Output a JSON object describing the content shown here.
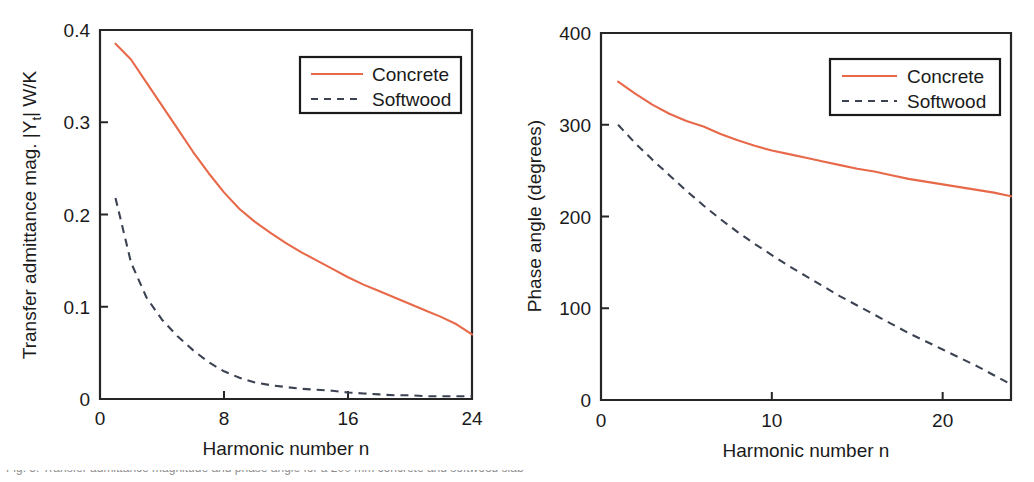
{
  "figure": {
    "background": "#ffffff",
    "concrete_color": "#e8694a",
    "softwood_color": "#3b4252",
    "axis_color": "#262626",
    "caption_fragment": "Fig. 5. Transfer admittance magnitude and phase angle for a 200 mm concrete and softwood slab"
  },
  "legend": {
    "concrete_label": "Concrete",
    "softwood_label": "Softwood"
  },
  "chart_data": [
    {
      "type": "line",
      "id": "transfer-admittance-magnitude",
      "title": "",
      "xlabel": "Harmonic number n",
      "ylabel": "Transfer admittance mag. |Y",
      "ylabel_sub": "t",
      "ylabel_tail": "| W/K",
      "xlim": [
        0,
        24
      ],
      "ylim": [
        0,
        0.4
      ],
      "xticks": [
        0,
        8,
        16,
        24
      ],
      "xticklabels": [
        "0",
        "8",
        "16",
        "24"
      ],
      "yticks": [
        0,
        0.1,
        0.2,
        0.3,
        0.4
      ],
      "yticklabels": [
        "0",
        "0.1",
        "0.2",
        "0.3",
        "0.4"
      ],
      "grid": false,
      "legend_position": "upper right",
      "x": [
        1,
        2,
        3,
        4,
        5,
        6,
        7,
        8,
        9,
        10,
        11,
        12,
        13,
        14,
        15,
        16,
        17,
        18,
        19,
        20,
        21,
        22,
        23,
        24
      ],
      "series": [
        {
          "name": "Concrete",
          "style": "solid",
          "color": "#e8694a",
          "values": [
            0.385,
            0.368,
            0.343,
            0.318,
            0.293,
            0.268,
            0.245,
            0.224,
            0.206,
            0.192,
            0.18,
            0.169,
            0.159,
            0.15,
            0.141,
            0.132,
            0.124,
            0.117,
            0.11,
            0.103,
            0.096,
            0.089,
            0.081,
            0.07
          ]
        },
        {
          "name": "Softwood",
          "style": "dashed",
          "color": "#3b4252",
          "values": [
            0.218,
            0.148,
            0.11,
            0.086,
            0.068,
            0.053,
            0.04,
            0.03,
            0.023,
            0.018,
            0.015,
            0.013,
            0.011,
            0.01,
            0.009,
            0.007,
            0.006,
            0.005,
            0.004,
            0.004,
            0.003,
            0.003,
            0.003,
            0.003
          ]
        }
      ]
    },
    {
      "type": "line",
      "id": "phase-angle",
      "title": "",
      "xlabel": "Harmonic number n",
      "ylabel": "Phase angle (degrees)",
      "xlim": [
        0,
        24
      ],
      "ylim": [
        0,
        400
      ],
      "xticks": [
        0,
        10,
        20
      ],
      "xticklabels": [
        "0",
        "10",
        "20"
      ],
      "yticks": [
        0,
        100,
        200,
        300,
        400
      ],
      "yticklabels": [
        "0",
        "100",
        "200",
        "300",
        "400"
      ],
      "grid": false,
      "legend_position": "upper right",
      "x": [
        1,
        2,
        3,
        4,
        5,
        6,
        7,
        8,
        9,
        10,
        11,
        12,
        13,
        14,
        15,
        16,
        17,
        18,
        19,
        20,
        21,
        22,
        23,
        24
      ],
      "series": [
        {
          "name": "Concrete",
          "style": "solid",
          "color": "#e8694a",
          "values": [
            347,
            334,
            322,
            312,
            304,
            298,
            290,
            283,
            277,
            272,
            268,
            264,
            260,
            256,
            252,
            249,
            245,
            241,
            238,
            235,
            232,
            229,
            226,
            222
          ]
        },
        {
          "name": "Softwood",
          "style": "dashed",
          "color": "#3b4252",
          "values": [
            300,
            280,
            262,
            245,
            228,
            212,
            197,
            183,
            170,
            158,
            146,
            135,
            124,
            113,
            103,
            93,
            83,
            73,
            64,
            55,
            46,
            37,
            27,
            17
          ]
        }
      ]
    }
  ]
}
